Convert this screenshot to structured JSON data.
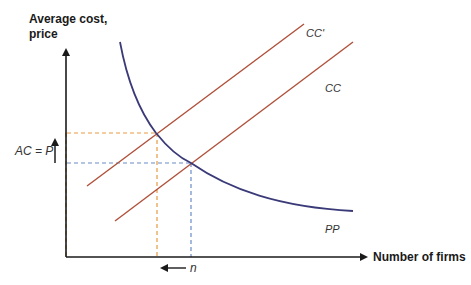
{
  "diagram": {
    "y_axis_label_line1": "Average cost,",
    "y_axis_label_line2": "price",
    "x_axis_label": "Number of firms",
    "ac_p_label": "AC = P",
    "n_label": "n",
    "curves": {
      "cc_prime": "CC'",
      "cc": "CC",
      "pp": "PP"
    },
    "colors": {
      "axis": "#1a1a1a",
      "pp_curve": "#3b3a78",
      "cc_lines": "#b0503a",
      "dash_orange": "#e89a40",
      "dash_blue": "#6a8cc8"
    }
  }
}
